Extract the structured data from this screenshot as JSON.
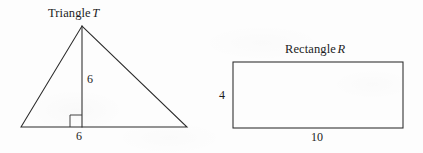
{
  "figure": {
    "background_color": "#fdfdfd",
    "line_color": "#2b2b2b",
    "shapes": [
      {
        "id": "triangle",
        "title_word": "Triangle",
        "title_symbol": "T",
        "kind": "triangle",
        "base_label": "6",
        "height_label": "6",
        "has_right_angle_mark": true,
        "apex": {
          "x": 82,
          "y": 26
        },
        "base_left": {
          "x": 21,
          "y": 127
        },
        "base_right": {
          "x": 187,
          "y": 127
        }
      },
      {
        "id": "rectangle",
        "title_word": "Rectangle",
        "title_symbol": "R",
        "kind": "rectangle",
        "width_label": "10",
        "height_label": "4",
        "left": 233,
        "top": 62,
        "right": 403,
        "bottom": 128
      }
    ]
  },
  "labels": {
    "triangle_title_word": "Triangle",
    "triangle_title_symbol": "T",
    "triangle_altitude": "6",
    "triangle_base": "6",
    "rectangle_title_word": "Rectangle",
    "rectangle_title_symbol": "R",
    "rectangle_height": "4",
    "rectangle_width": "10"
  }
}
